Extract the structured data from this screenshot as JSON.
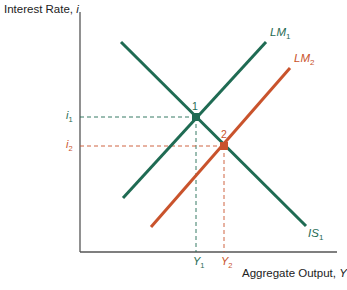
{
  "diagram": {
    "y_axis_label": "Interest Rate, ",
    "y_axis_var": "i",
    "x_axis_label": "Aggregate Output, ",
    "x_axis_var": "Y",
    "colors": {
      "green": "#1f6b53",
      "orange": "#c9532c",
      "axis": "#555555"
    },
    "curves": {
      "LM1": {
        "label": "LM",
        "sub": "1"
      },
      "LM2": {
        "label": "LM",
        "sub": "2"
      },
      "IS1": {
        "label": "IS",
        "sub": "1"
      }
    },
    "points": [
      {
        "label": "1",
        "i_label": "i",
        "i_sub": "1",
        "y_label": "Y",
        "y_sub": "1"
      },
      {
        "label": "2",
        "i_label": "i",
        "i_sub": "2",
        "y_label": "Y",
        "y_sub": "2"
      }
    ]
  }
}
